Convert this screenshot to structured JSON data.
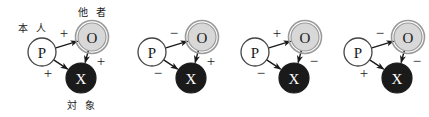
{
  "figure": {
    "name": "heider-balance-triads",
    "background_color": "#ffffff",
    "node_colors": {
      "p_fill": "#ffffff",
      "p_stroke": "#444444",
      "o_fill": "#d8d8d8",
      "o_stroke": "#9a9a9a",
      "x_fill": "#1a1a1a",
      "x_stroke": "#1a1a1a",
      "arrow": "#1a1a1a",
      "text_dark": "#1a1a1a",
      "text_light": "#ffffff"
    },
    "labels": {
      "p_label": "本 人",
      "o_label": "他 者",
      "x_label": "対 象"
    },
    "nodes": {
      "p": "P",
      "o": "O",
      "x": "X"
    },
    "triads": [
      {
        "id": "triad-1",
        "x_offset": 0,
        "show_jp_labels": true,
        "p_to_o": "+",
        "o_to_x": "+",
        "p_to_x": "+"
      },
      {
        "id": "triad-2",
        "x_offset": 110,
        "show_jp_labels": false,
        "p_to_o": "−",
        "o_to_x": "+",
        "p_to_x": "−"
      },
      {
        "id": "triad-3",
        "x_offset": 213,
        "show_jp_labels": false,
        "p_to_o": "+",
        "o_to_x": "−",
        "p_to_x": "−"
      },
      {
        "id": "triad-4",
        "x_offset": 316,
        "show_jp_labels": false,
        "p_to_o": "−",
        "o_to_x": "−",
        "p_to_x": "+"
      }
    ]
  }
}
